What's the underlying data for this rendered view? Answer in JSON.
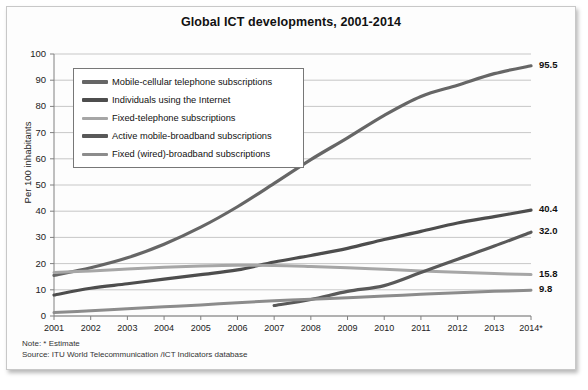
{
  "figure": {
    "title": "Global ICT developments, 2001-2014",
    "note": "Note: * Estimate",
    "source": "Source:  ITU World Telecommunication /ICT Indicators database"
  },
  "legend": {
    "items": [
      {
        "label": "Mobile-cellular telephone subscriptions",
        "color": "#666666"
      },
      {
        "label": "Individuals using the Internet",
        "color": "#4d4d4d"
      },
      {
        "label": "Fixed-telephone subscriptions",
        "color": "#a6a6a6"
      },
      {
        "label": "Active mobile-broadband subscriptions",
        "color": "#595959"
      },
      {
        "label": "Fixed (wired)-broadband subscriptions",
        "color": "#8c8c8c"
      }
    ]
  },
  "chart_data": {
    "type": "line",
    "title": "Global ICT developments, 2001-2014",
    "xlabel": "",
    "ylabel": "Per 100 inhabitants",
    "xlim": [
      2001,
      2014
    ],
    "ylim": [
      0,
      100
    ],
    "ytick_step": 10,
    "grid": true,
    "legend_position": "upper-left-inside",
    "x": [
      2001,
      2002,
      2003,
      2004,
      2005,
      2006,
      2007,
      2008,
      2009,
      2010,
      2011,
      2012,
      2013,
      2014
    ],
    "xticklabels": [
      "2001",
      "2002",
      "2003",
      "2004",
      "2005",
      "2006",
      "2007",
      "2008",
      "2009",
      "2010",
      "2011",
      "2012",
      "2013",
      "2014*"
    ],
    "yticklabels": [
      "0",
      "10",
      "20",
      "30",
      "40",
      "50",
      "60",
      "70",
      "80",
      "90",
      "100"
    ],
    "series": [
      {
        "name": "Mobile-cellular telephone subscriptions",
        "color": "#666666",
        "width": 3.2,
        "end_label": "95.5",
        "values": [
          15.5,
          18.4,
          22.2,
          27.4,
          33.9,
          41.7,
          50.6,
          59.7,
          68.0,
          76.6,
          83.8,
          88.1,
          92.5,
          95.5
        ]
      },
      {
        "name": "Individuals using the Internet",
        "color": "#4d4d4d",
        "width": 3.2,
        "end_label": "40.4",
        "values": [
          8.0,
          10.6,
          12.3,
          14.1,
          15.8,
          17.6,
          20.6,
          23.1,
          25.8,
          29.2,
          32.3,
          35.5,
          37.9,
          40.4
        ]
      },
      {
        "name": "Fixed-telephone subscriptions",
        "color": "#a6a6a6",
        "width": 3.0,
        "end_label": "15.8",
        "values": [
          16.6,
          17.2,
          17.9,
          18.6,
          19.1,
          19.4,
          19.3,
          18.9,
          18.4,
          17.8,
          17.2,
          16.7,
          16.2,
          15.8
        ]
      },
      {
        "name": "Active mobile-broadband subscriptions",
        "color": "#595959",
        "width": 3.2,
        "end_label": "32.0",
        "start_year": 2007,
        "values": [
          null,
          null,
          null,
          null,
          null,
          null,
          4.0,
          6.3,
          9.4,
          11.6,
          16.6,
          21.7,
          26.7,
          32.0
        ]
      },
      {
        "name": "Fixed (wired)-broadband subscriptions",
        "color": "#8c8c8c",
        "width": 3.0,
        "end_label": "9.8",
        "values": [
          1.3,
          2.0,
          2.8,
          3.5,
          4.2,
          5.1,
          5.8,
          6.4,
          7.0,
          7.6,
          8.3,
          8.9,
          9.4,
          9.8
        ]
      }
    ]
  }
}
